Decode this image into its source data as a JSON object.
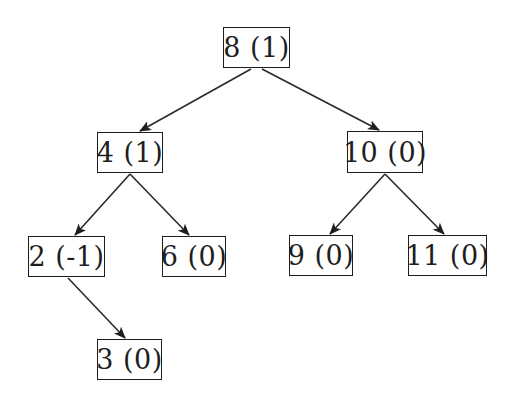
{
  "diagram": {
    "type": "avl-tree",
    "nodes": [
      {
        "id": "n8",
        "label": "8 (1)",
        "key": 8,
        "balance": 1,
        "box": {
          "x": 223,
          "y": 27,
          "w": 67,
          "h": 41
        }
      },
      {
        "id": "n4",
        "label": "4 (1)",
        "key": 4,
        "balance": 1,
        "box": {
          "x": 97,
          "y": 132,
          "w": 66,
          "h": 41
        }
      },
      {
        "id": "n10",
        "label": "10 (0)",
        "key": 10,
        "balance": 0,
        "box": {
          "x": 347,
          "y": 131,
          "w": 76,
          "h": 42
        }
      },
      {
        "id": "n2",
        "label": "2 (-1)",
        "key": 2,
        "balance": -1,
        "box": {
          "x": 28,
          "y": 236,
          "w": 77,
          "h": 41
        }
      },
      {
        "id": "n6",
        "label": "6 (0)",
        "key": 6,
        "balance": 0,
        "box": {
          "x": 162,
          "y": 236,
          "w": 64,
          "h": 41
        }
      },
      {
        "id": "n9",
        "label": "9 (0)",
        "key": 9,
        "balance": 0,
        "box": {
          "x": 289,
          "y": 235,
          "w": 64,
          "h": 41
        }
      },
      {
        "id": "n11",
        "label": "11 (0)",
        "key": 11,
        "balance": 0,
        "box": {
          "x": 408,
          "y": 235,
          "w": 79,
          "h": 41
        }
      },
      {
        "id": "n3",
        "label": "3 (0)",
        "key": 3,
        "balance": 0,
        "box": {
          "x": 97,
          "y": 339,
          "w": 65,
          "h": 41
        }
      }
    ],
    "edges": [
      {
        "from": "n8",
        "to": "n4",
        "x1": 251,
        "y1": 69,
        "x2": 140,
        "y2": 131
      },
      {
        "from": "n8",
        "to": "n10",
        "x1": 262,
        "y1": 69,
        "x2": 379,
        "y2": 130
      },
      {
        "from": "n4",
        "to": "n2",
        "x1": 130,
        "y1": 174,
        "x2": 75,
        "y2": 235
      },
      {
        "from": "n4",
        "to": "n6",
        "x1": 130,
        "y1": 174,
        "x2": 189,
        "y2": 235
      },
      {
        "from": "n10",
        "to": "n9",
        "x1": 385,
        "y1": 174,
        "x2": 330,
        "y2": 234
      },
      {
        "from": "n10",
        "to": "n11",
        "x1": 385,
        "y1": 174,
        "x2": 444,
        "y2": 234
      },
      {
        "from": "n2",
        "to": "n3",
        "x1": 68,
        "y1": 278,
        "x2": 125,
        "y2": 338
      }
    ],
    "colors": {
      "stroke": "#1e1e1e",
      "background": "#ffffff"
    }
  }
}
